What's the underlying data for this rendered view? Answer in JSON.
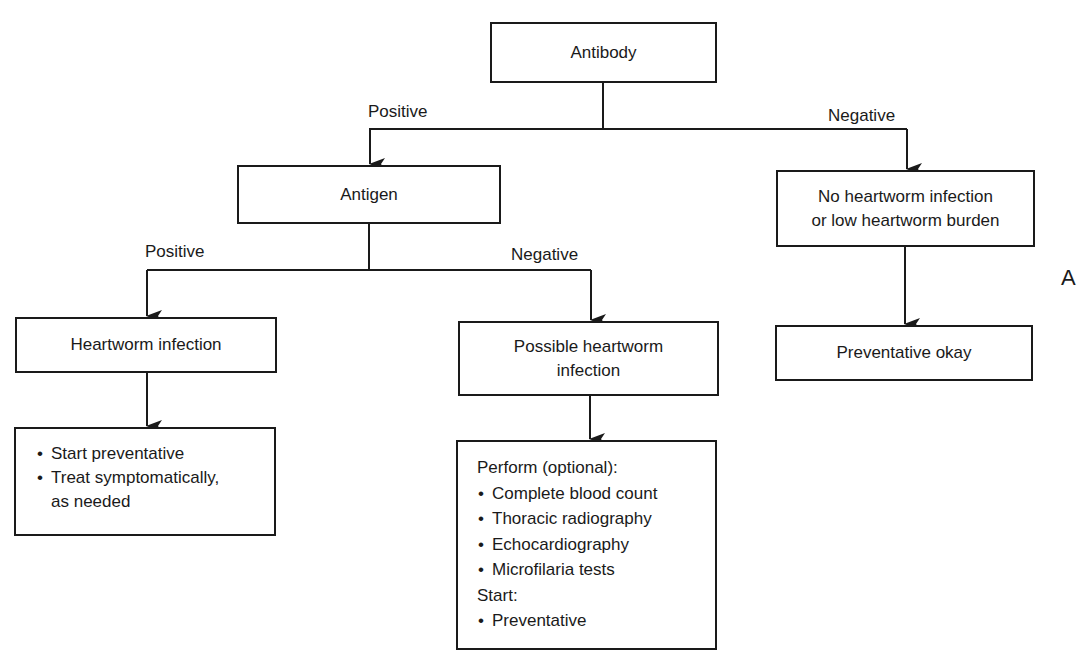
{
  "diagram": {
    "type": "flowchart",
    "panel_label": "A",
    "nodes": {
      "antibody": {
        "label": "Antibody"
      },
      "antigen": {
        "label": "Antigen"
      },
      "no_infection": {
        "line1": "No heartworm infection",
        "line2": "or low heartworm burden"
      },
      "heartworm_infection": {
        "label": "Heartworm infection"
      },
      "possible_infection": {
        "line1": "Possible heartworm",
        "line2": "infection"
      },
      "preventative_okay": {
        "label": "Preventative okay"
      },
      "treatment": {
        "items": [
          "Start preventative",
          "Treat symptomatically,",
          "as needed"
        ]
      },
      "workup": {
        "heading1": "Perform (optional):",
        "items1": [
          "Complete blood count",
          "Thoracic radiography",
          "Echocardiography",
          "Microfilaria tests"
        ],
        "heading2": "Start:",
        "items2": [
          "Preventative"
        ]
      }
    },
    "edge_labels": {
      "antibody_positive": "Positive",
      "antibody_negative": "Negative",
      "antigen_positive": "Positive",
      "antigen_negative": "Negative"
    },
    "edges": [
      {
        "from": "Antibody",
        "to": "Antigen",
        "label": "Positive"
      },
      {
        "from": "Antibody",
        "to": "No heartworm infection or low heartworm burden",
        "label": "Negative"
      },
      {
        "from": "Antigen",
        "to": "Heartworm infection",
        "label": "Positive"
      },
      {
        "from": "Antigen",
        "to": "Possible heartworm infection",
        "label": "Negative"
      },
      {
        "from": "No heartworm infection or low heartworm burden",
        "to": "Preventative okay",
        "label": ""
      },
      {
        "from": "Heartworm infection",
        "to": "Start preventative / Treat symptomatically",
        "label": ""
      },
      {
        "from": "Possible heartworm infection",
        "to": "Perform (optional) / Start",
        "label": ""
      }
    ]
  }
}
